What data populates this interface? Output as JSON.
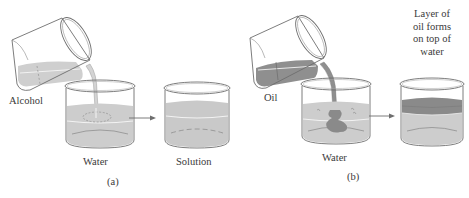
{
  "panels": [
    {
      "id": "a",
      "caption": "(a)",
      "labels": {
        "pouring_liquid": "Alcohol",
        "receiving_liquid": "Water",
        "result": "Solution"
      }
    },
    {
      "id": "b",
      "caption": "(b)",
      "labels": {
        "pouring_liquid": "Oil",
        "receiving_liquid": "Water",
        "result_lines": [
          "Layer of",
          "oil forms",
          "on top of",
          "water"
        ]
      }
    }
  ],
  "colors": {
    "glass_outline": "#6e6e6e",
    "alcohol": "#cfcfcf",
    "water": "#cdcdcd",
    "solution": "#c9c9c9",
    "oil": "#8f8f8f",
    "oil_layer": "#8a8a8a",
    "highlight": "#f2f2f2",
    "text": "#3a3a3a"
  }
}
